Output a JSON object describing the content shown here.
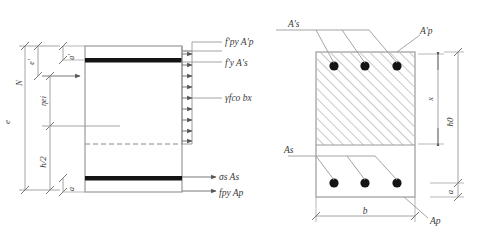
{
  "figure": {
    "line_color": "#888888",
    "dark_color": "#1a1a1a",
    "hatch_color": "#9a9a9a",
    "text_color": "#3a3a3a"
  },
  "left_diagram": {
    "name": "stress-distribution-diagram",
    "force_labels": {
      "top_prestress": "f'py A'p",
      "top_steel": "f'y A's",
      "concrete_block": "γfco bx",
      "bottom_steel": "σs As",
      "bottom_prestress": "fpy Ap"
    },
    "dimension_labels": {
      "axial_force": "N",
      "e_prime": "e'",
      "e": "e",
      "eta_ei": "ηei",
      "h_half": "h/2",
      "a_prime_top": "a'",
      "a_bottom": "a"
    }
  },
  "right_diagram": {
    "name": "cross-section-diagram",
    "rebar_labels": {
      "top_steel": "A's",
      "top_prestress": "A'p",
      "bottom_steel": "As",
      "bottom_prestress": "Ap"
    },
    "dimension_labels": {
      "compression_depth": "x",
      "effective_depth": "h0",
      "cover": "a",
      "width": "b"
    },
    "bar_count_top": 3,
    "bar_count_bottom": 3
  }
}
